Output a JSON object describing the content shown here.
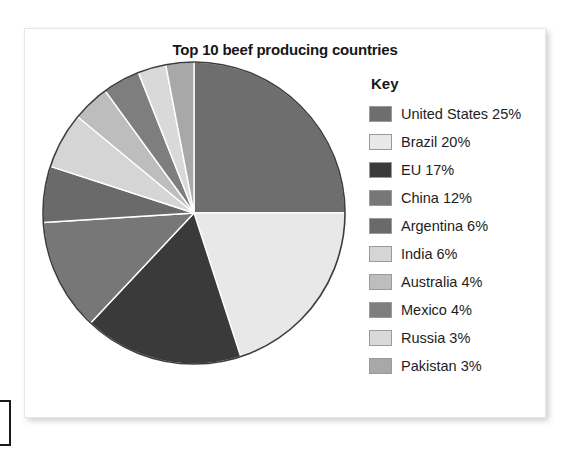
{
  "figure": {
    "title": "Top 10 beef producing countries"
  },
  "legend": {
    "title": "Key"
  },
  "chart_data": {
    "type": "pie",
    "title": "Top 10 beef producing countries",
    "legend_title": "Key",
    "legend_position": "right",
    "unit": "%",
    "start_angle_deg": 0,
    "direction": "clockwise",
    "categories": [
      "United States",
      "Brazil",
      "EU",
      "China",
      "Argentina",
      "India",
      "Australia",
      "Mexico",
      "Russia",
      "Pakistan"
    ],
    "values": [
      25,
      20,
      17,
      12,
      6,
      6,
      4,
      4,
      3,
      3
    ],
    "labels": [
      "United States 25%",
      "Brazil 20%",
      "EU 17%",
      "China 12%",
      "Argentina 6%",
      "India 6%",
      "Australia 4%",
      "Mexico 4%",
      "Russia 3%",
      "Pakistan 3%"
    ],
    "colors": [
      "#6e6e6e",
      "#e8e8e8",
      "#3a3a3a",
      "#777777",
      "#6a6a6a",
      "#d5d5d5",
      "#bdbdbd",
      "#7e7e7e",
      "#d9d9d9",
      "#a8a8a8"
    ],
    "slice_border_color": "#ffffff",
    "outline_color": "#3d3d3d"
  }
}
